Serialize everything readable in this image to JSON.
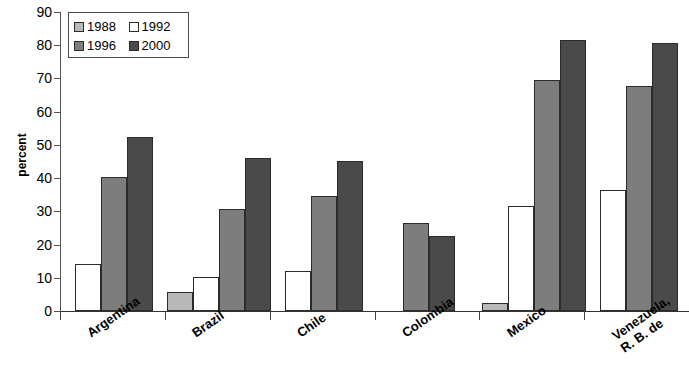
{
  "chart_data": {
    "type": "bar",
    "title": "",
    "xlabel": "",
    "ylabel": "percent",
    "ylim": [
      0,
      90
    ],
    "ytick_step": 10,
    "yticks": [
      0,
      10,
      20,
      30,
      40,
      50,
      60,
      70,
      80,
      90
    ],
    "grid": false,
    "legend_position": "top-left",
    "categories": [
      "Argentina",
      "Brazil",
      "Chile",
      "Colombia",
      "Mexico",
      "Venezuela, R. B. de"
    ],
    "series": [
      {
        "name": "1988",
        "color": "#b9b9b9",
        "values": [
          null,
          5.8,
          null,
          null,
          2.5,
          null
        ]
      },
      {
        "name": "1992",
        "color": "#ffffff",
        "values": [
          14.3,
          10.2,
          12.0,
          null,
          31.5,
          36.4
        ]
      },
      {
        "name": "1996",
        "color": "#7d7d7d",
        "values": [
          40.3,
          30.6,
          34.5,
          26.5,
          69.5,
          67.8
        ]
      },
      {
        "name": "2000",
        "color": "#4a4a4a",
        "values": [
          52.4,
          46.2,
          45.2,
          22.5,
          81.5,
          80.8
        ]
      }
    ]
  },
  "axis": {
    "y_title": "percent",
    "y_tick_labels": [
      "90",
      "80",
      "70",
      "60",
      "50",
      "40",
      "30",
      "20",
      "10",
      "0"
    ]
  },
  "legend": {
    "entries": [
      {
        "label": "1988",
        "swatch": "s1988"
      },
      {
        "label": "1992",
        "swatch": "s1992"
      },
      {
        "label": "1996",
        "swatch": "s1996"
      },
      {
        "label": "2000",
        "swatch": "s2000"
      }
    ]
  },
  "category_labels": [
    {
      "lines": [
        "Argentina"
      ]
    },
    {
      "lines": [
        "Brazil"
      ]
    },
    {
      "lines": [
        "Chile"
      ]
    },
    {
      "lines": [
        "Colombia"
      ]
    },
    {
      "lines": [
        "Mexico"
      ]
    },
    {
      "lines": [
        "Venezuela,",
        "R. B. de"
      ]
    }
  ]
}
